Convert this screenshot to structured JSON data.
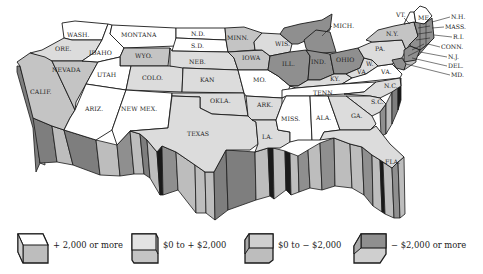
{
  "colors": {
    "cat_plus_2000_more": "#ffffff",
    "cat_0_to_plus_2000": "#dcdcdc",
    "cat_0_to_minus_2000": "#c4c4c4",
    "cat_minus_2000_more": "#8f8f8f",
    "wall_light": "#bdbdbd",
    "wall_dark": "#7e7e7e",
    "outline": "#1a1a1a"
  },
  "states": {
    "wash": "WASH.",
    "ore": "ORE.",
    "calif": "CALIF.",
    "idaho": "IDAHO",
    "nevada": "NEVADA",
    "montana": "MONTANA",
    "wyo": "WYO.",
    "utah": "UTAH",
    "colo": "COLO.",
    "ariz": "ARIZ.",
    "newmex": "NEW MEX.",
    "nd": "N.D.",
    "sd": "S.D.",
    "neb": "NEB.",
    "kan": "KAN",
    "okla": "OKLA.",
    "texas": "TEXAS",
    "minn": "MINN.",
    "iowa": "IOWA",
    "mo": "MO.",
    "ark": "ARK.",
    "la": "LA.",
    "wis": "WIS.",
    "ill": "ILL.",
    "mich": "MICH.",
    "ind": "IND.",
    "ohio": "OHIO",
    "ky": "KY.",
    "tenn": "TENN.",
    "miss": "MISS.",
    "ala": "ALA.",
    "ga": "GA.",
    "fla": "FLA.",
    "sc": "S.C.",
    "nc": "N.C.",
    "va": "VA.",
    "wva_w": "W.",
    "wva_va": "VA.",
    "pa": "PA.",
    "ny": "N.Y.",
    "vt": "VT.",
    "me": "ME.",
    "nh": "N.H.",
    "mass": "MASS.",
    "ri": "R.I.",
    "conn": "CONN.",
    "nj": "N.J.",
    "del": "DEL.",
    "md": "MD."
  },
  "legend": [
    {
      "label": "+ 2,000 or more",
      "swatch": "white"
    },
    {
      "label": "$0 to  + $2,000",
      "swatch": "light"
    },
    {
      "label": "$0 to  − $2,000",
      "swatch": "medium"
    },
    {
      "label": "− $2,000 or more",
      "swatch": "dark"
    }
  ]
}
